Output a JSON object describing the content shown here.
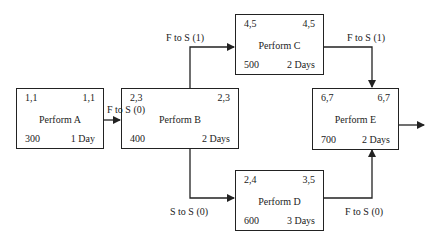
{
  "nodes": {
    "A": {
      "title": "Perform  A",
      "es": "1,1",
      "ef": "1,1",
      "cost": "300",
      "duration": "1 Day"
    },
    "B": {
      "title": "Perform  B",
      "es": "2,3",
      "ef": "2,3",
      "cost": "400",
      "duration": "2 Days"
    },
    "C": {
      "title": "Perform  C",
      "es": "4,5",
      "ef": "4,5",
      "cost": "500",
      "duration": "2 Days"
    },
    "D": {
      "title": "Perform  D",
      "es": "2,4",
      "ef": "3,5",
      "cost": "600",
      "duration": "3 Days"
    },
    "E": {
      "title": "Perform  E",
      "es": "6,7",
      "ef": "6,7",
      "cost": "700",
      "duration": "2 Days"
    }
  },
  "links": {
    "a_to_b": "F to S (0)",
    "b_to_c": "F to S (1)",
    "c_to_e": "F to S (1)",
    "b_to_d": "S to S (0)",
    "d_to_e": "F to S (0)"
  },
  "colors": {
    "line": "#222222",
    "background": "#ffffff"
  }
}
